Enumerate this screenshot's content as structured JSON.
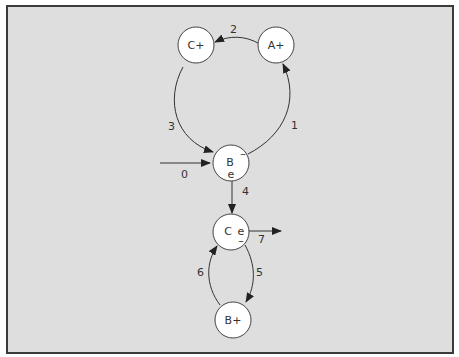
{
  "diagram": {
    "type": "state-transition-graph",
    "background": "#dedede",
    "border_color": "#3a3a3a",
    "nodes": [
      {
        "id": "C+",
        "label": "C+",
        "x": 196,
        "y": 45
      },
      {
        "id": "A+",
        "label": "A+",
        "x": 276,
        "y": 45
      },
      {
        "id": "B",
        "label": "B",
        "sub_top": "–",
        "sub_bottom": "e",
        "x": 230,
        "y": 163
      },
      {
        "id": "C",
        "label": "C",
        "sub_right": "e",
        "sub_bottom": "–",
        "x": 230,
        "y": 232
      },
      {
        "id": "B+",
        "label": "B+",
        "x": 233,
        "y": 320
      }
    ],
    "edges": [
      {
        "label": "0",
        "from": "entry",
        "to": "B"
      },
      {
        "label": "1",
        "from": "B",
        "to": "A+"
      },
      {
        "label": "2",
        "from": "A+",
        "to": "C+"
      },
      {
        "label": "3",
        "from": "C+",
        "to": "B"
      },
      {
        "label": "4",
        "from": "B",
        "to": "C"
      },
      {
        "label": "5",
        "from": "C",
        "to": "B+"
      },
      {
        "label": "6",
        "from": "B+",
        "to": "C"
      },
      {
        "label": "7",
        "from": "C",
        "to": "exit"
      }
    ]
  }
}
